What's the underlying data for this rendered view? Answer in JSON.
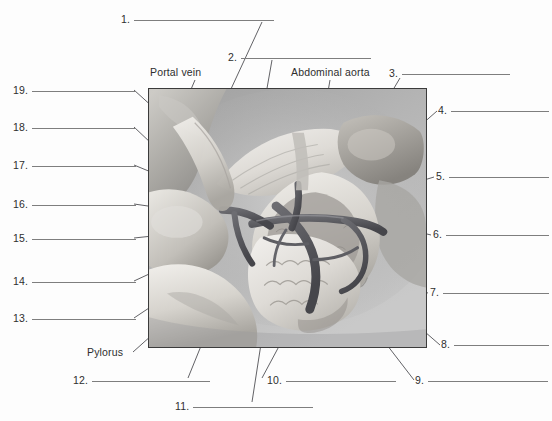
{
  "worksheet": {
    "kind": "anatomy-labeling-figure",
    "subject": "pancreas and duodenum with associated vasculature",
    "background_color": "#fdfdfd",
    "rule_color": "#7e7e7e",
    "leader_color": "#46464a",
    "frame_color": "#3b3b3b"
  },
  "named_labels": [
    {
      "id": "portal-vein",
      "text": "Portal vein"
    },
    {
      "id": "abdominal-aorta",
      "text": "Abdominal aorta"
    },
    {
      "id": "pylorus",
      "text": "Pylorus"
    }
  ],
  "numbered_labels": [
    {
      "n": "1.",
      "answer": ""
    },
    {
      "n": "2.",
      "answer": ""
    },
    {
      "n": "3.",
      "answer": ""
    },
    {
      "n": "4.",
      "answer": ""
    },
    {
      "n": "5.",
      "answer": ""
    },
    {
      "n": "6.",
      "answer": ""
    },
    {
      "n": "7.",
      "answer": ""
    },
    {
      "n": "8.",
      "answer": ""
    },
    {
      "n": "9.",
      "answer": ""
    },
    {
      "n": "10.",
      "answer": ""
    },
    {
      "n": "11.",
      "answer": ""
    },
    {
      "n": "12.",
      "answer": ""
    },
    {
      "n": "13.",
      "answer": ""
    },
    {
      "n": "14.",
      "answer": ""
    },
    {
      "n": "15.",
      "answer": ""
    },
    {
      "n": "16.",
      "answer": ""
    },
    {
      "n": "17.",
      "answer": ""
    },
    {
      "n": "18.",
      "answer": ""
    },
    {
      "n": "19.",
      "answer": ""
    }
  ],
  "illustration": {
    "frame": {
      "x": 148,
      "y": 88,
      "width": 279,
      "height": 260
    },
    "palette": {
      "backdrop": "#adadad",
      "backdrop_light": "#c6c6c6",
      "organ_light": "#e3e1dc",
      "organ_mid": "#c9c6c0",
      "organ_dark": "#9a9791",
      "vessel_dark": "#58585c",
      "vessel_mid": "#76767a",
      "highlight": "#f2f1ee",
      "shadow": "#7d7d80"
    }
  }
}
